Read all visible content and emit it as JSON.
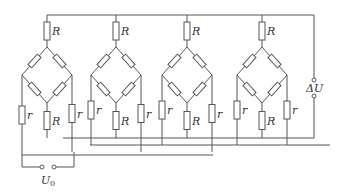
{
  "diagram": {
    "title": "",
    "bridges": [
      {
        "id": 1,
        "top_label": "R",
        "bottom_label": "R",
        "left_label": "r",
        "right_label": "r",
        "cx": 47
      },
      {
        "id": 2,
        "top_label": "R",
        "bottom_label": "R",
        "left_label": "r",
        "right_label": "r",
        "cx": 116
      },
      {
        "id": 3,
        "top_label": "R",
        "bottom_label": "R",
        "left_label": "r",
        "right_label": "r",
        "cx": 187
      },
      {
        "id": 4,
        "top_label": "R",
        "bottom_label": "R",
        "left_label": "r",
        "right_label": "r",
        "cx": 262
      }
    ],
    "input_label": "U",
    "input_subscript": "0",
    "output_label": "ΔU"
  }
}
